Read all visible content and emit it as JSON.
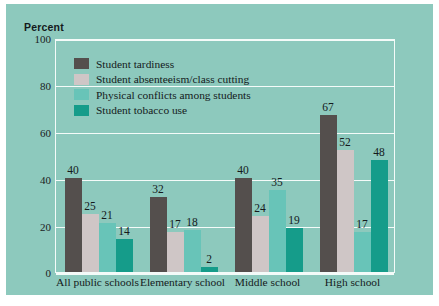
{
  "chart_data": {
    "type": "bar",
    "title": "",
    "ylabel": "Percent",
    "xlabel": "",
    "ylim": [
      0,
      100
    ],
    "yticks": [
      0,
      20,
      40,
      60,
      80,
      100
    ],
    "grid": true,
    "legend_position": "upper-left-inside",
    "categories": [
      "All public schools",
      "Elementary school",
      "Middle school",
      "High school"
    ],
    "series": [
      {
        "name": "Student tardiness",
        "color": "#544f4d",
        "values": [
          40,
          32,
          40,
          67
        ]
      },
      {
        "name": "Student absenteeism/class cutting",
        "color": "#cfc6c6",
        "values": [
          25,
          17,
          24,
          52
        ]
      },
      {
        "name": "Physical conflicts among students",
        "color": "#68c4b8",
        "values": [
          21,
          18,
          35,
          17
        ]
      },
      {
        "name": "Student tobacco use",
        "color": "#159c8a",
        "values": [
          14,
          2,
          19,
          48
        ]
      }
    ]
  },
  "figure": {
    "background_color": "#8dc9bd",
    "grid_color": "#f4fbf9",
    "text_color": "#141a1c"
  }
}
